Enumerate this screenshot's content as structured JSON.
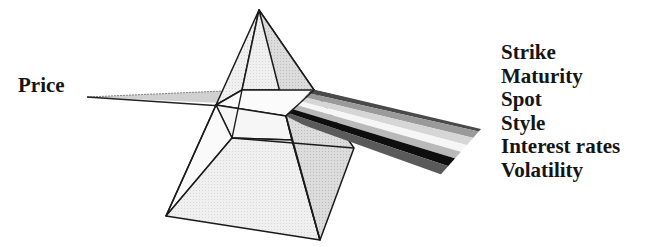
{
  "diagram": {
    "type": "prism-metaphor",
    "input_label": "Price",
    "output_labels": [
      "Strike",
      "Maturity",
      "Spot",
      "Style",
      "Interest rates",
      "Volatility"
    ],
    "top_clipped_text": "",
    "beam_stripe_colors": [
      "#4a4a4a",
      "#9a9a9a",
      "#d6d6d6",
      "#f6f6f6",
      "#b9b9b9",
      "#0e0e0e",
      "#5a5a5a"
    ],
    "colors": {
      "outline": "#1a1a1a",
      "face_light": "#f1f1f1",
      "face_mid": "#e4e4e4",
      "face_dark": "#cfcfcf",
      "text": "#151515"
    }
  }
}
